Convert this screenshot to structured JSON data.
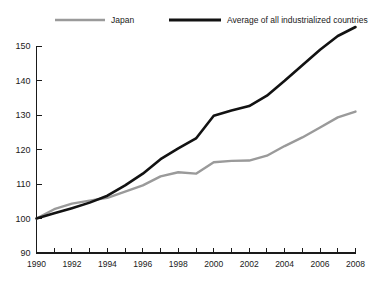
{
  "chart_data": {
    "type": "line",
    "title": "",
    "subtitle": "",
    "xlabel": "",
    "ylabel": "",
    "xlim": [
      1990,
      2008
    ],
    "ylim": [
      90,
      150
    ],
    "x_tick_step": 2,
    "x_minor_tick_step": 1,
    "y_tick_step": 10,
    "grid": false,
    "legend_position": "top",
    "x_tick_labels": [
      "1990",
      "1992",
      "1994",
      "1996",
      "1998",
      "2000",
      "2002",
      "2004",
      "2006",
      "2008"
    ],
    "y_tick_labels": [
      "90",
      "100",
      "110",
      "120",
      "130",
      "140",
      "150"
    ],
    "x": [
      1990,
      1991,
      1992,
      1993,
      1994,
      1995,
      1996,
      1997,
      1998,
      1999,
      2000,
      2001,
      2002,
      2003,
      2004,
      2005,
      2006,
      2007,
      2008
    ],
    "series": [
      {
        "name": "Japan",
        "color": "#9a9a9a",
        "stroke_width": 2.4,
        "values": [
          100.0,
          102.7,
          104.3,
          105.2,
          106.0,
          107.8,
          109.6,
          112.2,
          113.4,
          113.0,
          116.3,
          116.7,
          116.8,
          118.2,
          121.0,
          123.5,
          126.4,
          129.3,
          131.0
        ]
      },
      {
        "name": "Average of all industrialized countries",
        "color": "#121212",
        "stroke_width": 2.6,
        "values": [
          100.0,
          101.5,
          103.0,
          104.6,
          106.6,
          109.6,
          113.0,
          117.2,
          120.3,
          123.2,
          129.8,
          131.3,
          132.6,
          135.6,
          139.9,
          144.4,
          148.9,
          152.9,
          155.5
        ]
      }
    ]
  },
  "legend": {
    "items": [
      {
        "label": "Japan",
        "color": "#9a9a9a"
      },
      {
        "label": "Average of all industrialized countries",
        "color": "#121212"
      }
    ]
  }
}
